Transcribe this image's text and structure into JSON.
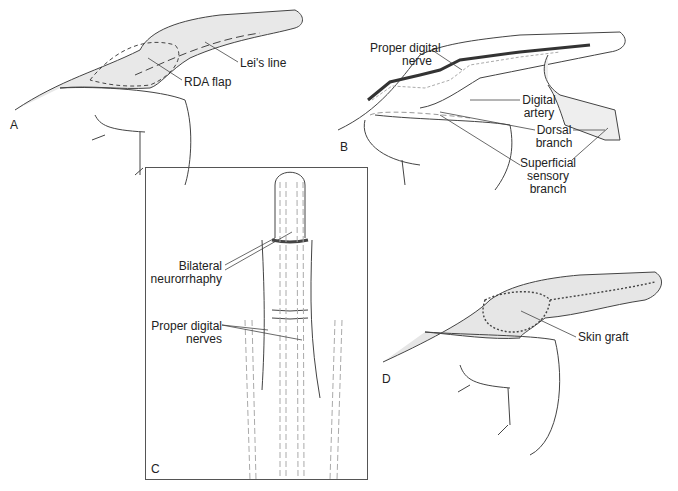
{
  "figure": {
    "panels": [
      {
        "letter": "A",
        "labels": {
          "leis_line": "Lei's line",
          "rda_flap": "RDA flap"
        }
      },
      {
        "letter": "B",
        "labels": {
          "proper_digital_nerve": "Proper digital\nnerve",
          "digital_artery": "Digital\nartery",
          "dorsal_branch": "Dorsal\nbranch",
          "superficial_sensory_branch": "Superficial\nsensory\nbranch"
        }
      },
      {
        "letter": "C",
        "labels": {
          "bilateral_neurorrhaphy": "Bilateral\nneurorrhaphy",
          "proper_digital_nerves": "Proper digital\nnerves"
        }
      },
      {
        "letter": "D",
        "labels": {
          "skin_graft": "Skin graft"
        }
      }
    ]
  },
  "colors": {
    "skin_fill": "#e4e4e4",
    "line": "#333333",
    "dashed": "#999999"
  }
}
